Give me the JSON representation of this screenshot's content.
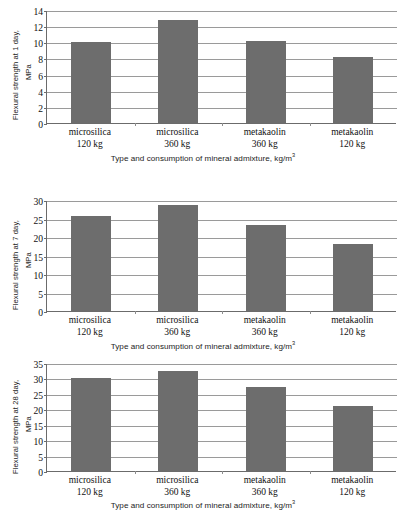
{
  "figure": {
    "shared_x_axis_title": "Type and consumption of mineral admixture, kg/m",
    "shared_x_axis_title_sup": "3",
    "categories": [
      {
        "name": "microsilica",
        "dose": "120 kg"
      },
      {
        "name": "microsilica",
        "dose": "360 kg"
      },
      {
        "name": "metakaolin",
        "dose": "360 kg"
      },
      {
        "name": "metakaolin",
        "dose": "120 kg"
      }
    ],
    "bar_color": "#6d6d6d",
    "grid_color": "#9a9a9a",
    "axis_color": "#6b6b6b"
  },
  "chart_data": [
    {
      "type": "bar",
      "title": "",
      "ylabel_line1": "Flexural strength at 1 day,",
      "ylabel_line2": "MPa",
      "xlabel": "Type and consumption of mineral admixture, kg/m3",
      "categories": [
        "microsilica 120 kg",
        "microsilica 360 kg",
        "metakaolin 360 kg",
        "metakaolin 120 kg"
      ],
      "values": [
        10.0,
        12.8,
        10.1,
        8.2
      ],
      "yticks": [
        0,
        2,
        4,
        6,
        8,
        10,
        12,
        14
      ],
      "ylim": [
        0,
        14
      ],
      "grid": true,
      "legend": "none"
    },
    {
      "type": "bar",
      "title": "",
      "ylabel_line1": "Flexural strength at 7 day,",
      "ylabel_line2": "MPa",
      "xlabel": "Type and consumption of mineral admixture, kg/m3",
      "categories": [
        "microsilica 120 kg",
        "microsilica 360 kg",
        "metakaolin 360 kg",
        "metakaolin 120 kg"
      ],
      "values": [
        25.6,
        28.7,
        23.3,
        18.0
      ],
      "yticks": [
        0,
        5,
        10,
        15,
        20,
        25,
        30
      ],
      "ylim": [
        0,
        30
      ],
      "grid": true,
      "legend": "none"
    },
    {
      "type": "bar",
      "title": "",
      "ylabel_line1": "Flexural strength at 28 day,",
      "ylabel_line2": "MPa",
      "xlabel": "Type and consumption of mineral admixture, kg/m3",
      "categories": [
        "microsilica 120 kg",
        "microsilica 360 kg",
        "metakaolin 360 kg",
        "metakaolin 120 kg"
      ],
      "values": [
        30.0,
        32.5,
        27.3,
        21.1
      ],
      "yticks": [
        0,
        5,
        10,
        15,
        20,
        25,
        30,
        35
      ],
      "ylim": [
        0,
        35
      ],
      "grid": true,
      "legend": "none"
    }
  ]
}
